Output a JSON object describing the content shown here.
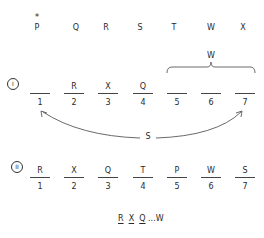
{
  "top_row": {
    "marker": "*",
    "letters": [
      "P",
      "Q",
      "R",
      "S",
      "T",
      "W",
      "X"
    ],
    "marked_letter": "P"
  },
  "brace_label": "W",
  "section_1": {
    "label": "I",
    "slots": [
      {
        "letter": "",
        "number": "1"
      },
      {
        "letter": "R",
        "number": "2"
      },
      {
        "letter": "X",
        "number": "3"
      },
      {
        "letter": "Q",
        "number": "4"
      },
      {
        "letter": "",
        "number": "5"
      },
      {
        "letter": "",
        "number": "6"
      },
      {
        "letter": "",
        "number": "7"
      }
    ],
    "arrow_label": "S",
    "arrow_from": "1",
    "arrow_to": "7",
    "brace_covers": [
      "5",
      "6",
      "7"
    ]
  },
  "section_2": {
    "label": "II",
    "slots": [
      {
        "letter": "R",
        "number": "1"
      },
      {
        "letter": "X",
        "number": "2"
      },
      {
        "letter": "Q",
        "number": "3"
      },
      {
        "letter": "T",
        "number": "4"
      },
      {
        "letter": "P",
        "number": "5"
      },
      {
        "letter": "W",
        "number": "6"
      },
      {
        "letter": "S",
        "number": "7"
      }
    ]
  },
  "summary": {
    "letters": [
      "R",
      "X",
      "Q"
    ],
    "ellipsis": "...",
    "last": "W"
  },
  "colors": {
    "ink": "#2a2a2a",
    "background": "#ffffff"
  }
}
